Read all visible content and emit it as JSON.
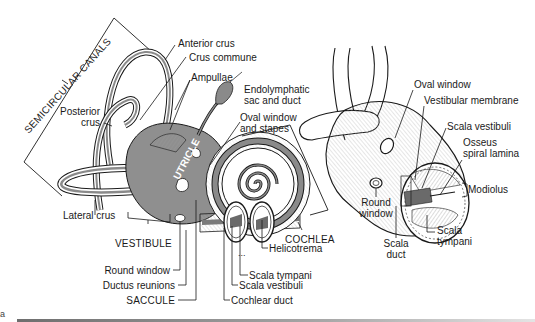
{
  "figure": {
    "part_letter": "a",
    "left_view": {
      "group_labels": {
        "semicircular_canals": "SEMICIRCULAR CANALS",
        "vestibule": "VESTIBULE",
        "cochlea": "COCHLEA",
        "utricle": "UTRICLE",
        "saccule": "SACCULE"
      },
      "labels": [
        {
          "id": "anterior_crus",
          "text": "Anterior crus"
        },
        {
          "id": "crus_commune",
          "text": "Crus commune"
        },
        {
          "id": "ampullae",
          "text": "Ampullae"
        },
        {
          "id": "endolymphatic",
          "line1": "Endolymphatic",
          "line2": "sac and duct"
        },
        {
          "id": "oval_window_stapes",
          "line1": "Oval window",
          "line2": "and stapes"
        },
        {
          "id": "posterior_crus",
          "line1": "Posterior",
          "line2": "crus"
        },
        {
          "id": "lateral_crus",
          "text": "Lateral crus"
        },
        {
          "id": "round_window",
          "text": "Round window"
        },
        {
          "id": "ductus_reunions",
          "text": "Ductus reunions"
        },
        {
          "id": "helicotrema",
          "text": "Helicotrema"
        },
        {
          "id": "scala_tympani",
          "text": "Scala tympani"
        },
        {
          "id": "scala_vestibuli",
          "text": "Scala vestibuli"
        },
        {
          "id": "cochlear_duct",
          "text": "Cochlear duct"
        }
      ]
    },
    "right_view": {
      "labels": [
        {
          "id": "oval_window",
          "text": "Oval window"
        },
        {
          "id": "vestibular_membrane",
          "text": "Vestibular membrane"
        },
        {
          "id": "scala_vestibuli",
          "text": "Scala vestibuli"
        },
        {
          "id": "osseus_spiral_lamina",
          "line1": "Osseus",
          "line2": "spiral lamina"
        },
        {
          "id": "modiolus",
          "text": "Modiolus"
        },
        {
          "id": "round_window",
          "line1": "Round",
          "line2": "window"
        },
        {
          "id": "cochlear_duct",
          "line1": "Cochlear",
          "line2": "duct"
        },
        {
          "id": "scala_tympani",
          "line1": "Scala",
          "line2": "tympani"
        }
      ]
    },
    "colors": {
      "ink": "#1a1a1a",
      "fill_gray": "#8a8a8a",
      "light_gray": "#d0d0d0",
      "paper": "#ffffff"
    }
  }
}
